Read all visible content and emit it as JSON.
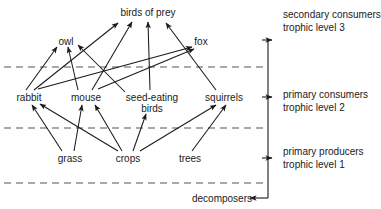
{
  "diagram": {
    "nodes": [
      {
        "id": "birds_of_prey",
        "label": "birds of prey",
        "x": 148,
        "y": 12,
        "level": 3
      },
      {
        "id": "owl",
        "label": "owl",
        "x": 66,
        "y": 41,
        "level": 3
      },
      {
        "id": "fox",
        "label": "fox",
        "x": 201,
        "y": 41,
        "level": 3
      },
      {
        "id": "rabbit",
        "label": "rabbit",
        "x": 29,
        "y": 97,
        "level": 2
      },
      {
        "id": "mouse",
        "label": "mouse",
        "x": 86,
        "y": 97,
        "level": 2
      },
      {
        "id": "seed_eating_birds",
        "label": "seed-eating birds",
        "x": 152,
        "y": 103,
        "level": 2
      },
      {
        "id": "squirrels",
        "label": "squirrels",
        "x": 224,
        "y": 97,
        "level": 2
      },
      {
        "id": "grass",
        "label": "grass",
        "x": 70,
        "y": 158,
        "level": 1
      },
      {
        "id": "crops",
        "label": "crops",
        "x": 128,
        "y": 158,
        "level": 1
      },
      {
        "id": "trees",
        "label": "trees",
        "x": 190,
        "y": 158,
        "level": 1
      },
      {
        "id": "decomposers",
        "label": "decomposers",
        "x": 222,
        "y": 198,
        "level": 0
      }
    ],
    "edges": [
      {
        "from": "rabbit",
        "to": "owl"
      },
      {
        "from": "mouse",
        "to": "owl"
      },
      {
        "from": "seed_eating_birds",
        "to": "owl"
      },
      {
        "from": "rabbit",
        "to": "birds_of_prey"
      },
      {
        "from": "mouse",
        "to": "birds_of_prey"
      },
      {
        "from": "seed_eating_birds",
        "to": "birds_of_prey"
      },
      {
        "from": "squirrels",
        "to": "birds_of_prey"
      },
      {
        "from": "rabbit",
        "to": "fox"
      },
      {
        "from": "mouse",
        "to": "fox"
      },
      {
        "from": "grass",
        "to": "rabbit"
      },
      {
        "from": "crops",
        "to": "rabbit"
      },
      {
        "from": "grass",
        "to": "mouse"
      },
      {
        "from": "crops",
        "to": "mouse"
      },
      {
        "from": "crops",
        "to": "seed_eating_birds"
      },
      {
        "from": "crops",
        "to": "squirrels"
      },
      {
        "from": "trees",
        "to": "squirrels"
      }
    ],
    "dashed_dividers": [
      {
        "name": "divider-level3-level2",
        "y": 67
      },
      {
        "name": "divider-level2-level1",
        "y": 128
      },
      {
        "name": "divider-level1-decomposers",
        "y": 183
      }
    ],
    "bracket": {
      "x": 268,
      "arrow_ys": [
        40,
        97,
        158
      ],
      "bottom_y": 198,
      "decomposer_arrow_x": 234
    }
  },
  "side_labels": [
    {
      "id": "secondary",
      "line1": "secondary consumers",
      "line2": "trophic level 3",
      "x": 283,
      "y": 8
    },
    {
      "id": "primary_consumers",
      "line1": "primary consumers",
      "line2": "trophic level 2",
      "x": 283,
      "y": 88
    },
    {
      "id": "primary_producers",
      "line1": "primary producers",
      "line2": "trophic level 1",
      "x": 283,
      "y": 145
    }
  ]
}
